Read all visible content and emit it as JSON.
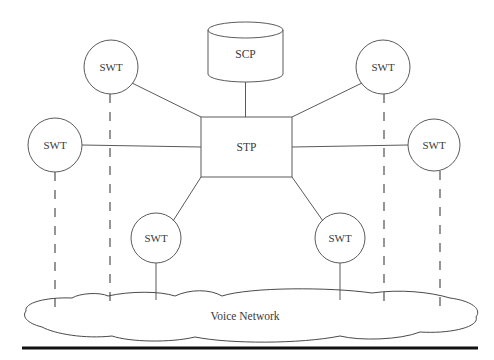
{
  "diagram": {
    "background_color": "#ffffff",
    "stroke_color": "#5b5b5b",
    "text_color": "#3a3a3a",
    "nodes": {
      "database": {
        "label": "SCP",
        "shape": "cylinder",
        "cx": 245.5,
        "cy": 54,
        "rx": 37.5,
        "ry": 8,
        "top": 22,
        "bottom": 82
      },
      "hub": {
        "label": "STP",
        "shape": "rectangle",
        "x": 201,
        "y": 117,
        "width": 91,
        "height": 60
      },
      "cloud": {
        "label": "Voice Network",
        "shape": "cloud",
        "text_x": 245,
        "text_y": 317
      },
      "switches": [
        {
          "label": "SWT",
          "id": "swt-top-left",
          "cx": 111,
          "cy": 67,
          "r": 27
        },
        {
          "label": "SWT",
          "id": "swt-left",
          "cx": 55,
          "cy": 145,
          "r": 27
        },
        {
          "label": "SWT",
          "id": "swt-bottom-left",
          "cx": 156,
          "cy": 238,
          "r": 25
        },
        {
          "label": "SWT",
          "id": "swt-top-right",
          "cx": 383,
          "cy": 67,
          "r": 27
        },
        {
          "label": "SWT",
          "id": "swt-right",
          "cx": 434,
          "cy": 145,
          "r": 26
        },
        {
          "label": "SWT",
          "id": "swt-bottom-right",
          "cx": 340,
          "cy": 238,
          "r": 25
        }
      ]
    },
    "links": {
      "signaling_solid": [
        {
          "id": "scp-to-stp",
          "x1": 245.5,
          "y1": 82,
          "x2": 245.5,
          "y2": 117
        },
        {
          "id": "swt-top-left-to-stp",
          "x1": 132,
          "y1": 83,
          "x2": 201,
          "y2": 117
        },
        {
          "id": "swt-left-to-stp",
          "x1": 82,
          "y1": 145,
          "x2": 201,
          "y2": 147
        },
        {
          "id": "swt-bottom-left-to-stp",
          "x1": 173,
          "y1": 221,
          "x2": 201,
          "y2": 177
        },
        {
          "id": "swt-top-right-to-stp",
          "x1": 362,
          "y1": 83,
          "x2": 292,
          "y2": 117
        },
        {
          "id": "swt-right-to-stp",
          "x1": 408,
          "y1": 145,
          "x2": 292,
          "y2": 147
        },
        {
          "id": "swt-bottom-right-to-stp",
          "x1": 323,
          "y1": 221,
          "x2": 292,
          "y2": 177
        }
      ],
      "trunk_dashed": [
        {
          "id": "swt-left-to-cloud",
          "x1": 55,
          "y1": 172,
          "x2": 55,
          "y2": 312
        },
        {
          "id": "swt-top-left-to-cloud",
          "x1": 110,
          "y1": 94,
          "x2": 110,
          "y2": 301
        },
        {
          "id": "swt-top-right-to-cloud",
          "x1": 384,
          "y1": 94,
          "x2": 384,
          "y2": 301
        },
        {
          "id": "swt-right-to-cloud",
          "x1": 440,
          "y1": 171,
          "x2": 440,
          "y2": 309
        }
      ],
      "trunk_solid": [
        {
          "id": "swt-bottom-left-to-cloud",
          "x1": 156,
          "y1": 263,
          "x2": 156,
          "y2": 300
        },
        {
          "id": "swt-bottom-right-to-cloud",
          "x1": 340,
          "y1": 263,
          "x2": 340,
          "y2": 300
        }
      ]
    },
    "footer_rule": {
      "x1": 22,
      "y1": 348,
      "x2": 478,
      "y2": 348
    }
  }
}
